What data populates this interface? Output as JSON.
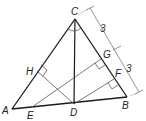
{
  "diagram": {
    "type": "geometry-triangle",
    "colors": {
      "stroke_main": "#1a1a1a",
      "stroke_thin": "#555555",
      "dimension": "#666666",
      "background": "#ffffff"
    },
    "points": {
      "A": {
        "label": "A",
        "x": 12,
        "y": 109
      },
      "B": {
        "label": "B",
        "x": 127,
        "y": 97
      },
      "C": {
        "label": "C",
        "x": 75,
        "y": 19
      },
      "D": {
        "label": "D",
        "x": 74,
        "y": 104
      },
      "E": {
        "label": "E",
        "x": 32,
        "y": 107
      },
      "F": {
        "label": "F",
        "x": 114,
        "y": 79
      },
      "G": {
        "label": "G",
        "x": 101,
        "y": 59
      },
      "H": {
        "label": "H",
        "x": 37,
        "y": 71
      }
    },
    "labels": {
      "A": "A",
      "B": "B",
      "C": "C",
      "D": "D",
      "E": "E",
      "F": "F",
      "G": "G",
      "H": "H"
    },
    "dimensions": [
      {
        "segment": "C-G",
        "value": "3"
      },
      {
        "segment": "G-B",
        "value": "3"
      }
    ],
    "segments": [
      "A-B",
      "B-C",
      "C-A",
      "C-D",
      "D-H",
      "D-F",
      "E-G"
    ],
    "right_angles": [
      "H",
      "G",
      "F"
    ],
    "angle_marks": [
      "ACD",
      "DCB"
    ]
  }
}
